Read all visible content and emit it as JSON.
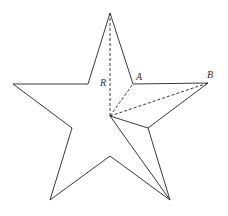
{
  "diagram": {
    "title": "",
    "labels": {
      "R": "R",
      "A": "A",
      "B": "B"
    },
    "points": {
      "top": [
        110,
        13
      ],
      "A": [
        133,
        84
      ],
      "B": [
        208,
        83
      ],
      "inner_right_lower": [
        148,
        128
      ],
      "bottom_right": [
        170,
        200
      ],
      "bottom_inner": [
        110,
        156
      ],
      "bottom_left": [
        50,
        200
      ],
      "inner_left_lower": [
        72,
        128
      ],
      "left": [
        13,
        84
      ],
      "inner_left_upper": [
        88,
        84
      ],
      "center": [
        110,
        116
      ]
    },
    "colors": {
      "stroke": "#3a3a3a",
      "background": "#ffffff"
    }
  }
}
